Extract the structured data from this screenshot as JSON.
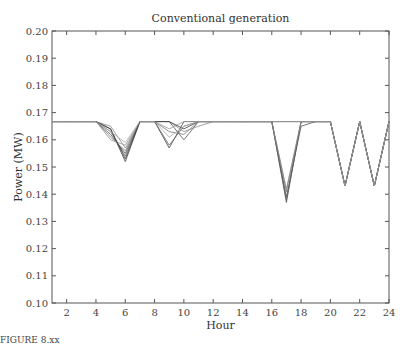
{
  "chart_data": {
    "type": "line",
    "title": "Conventional generation",
    "xlabel": "Hour",
    "ylabel": "Power (MW)",
    "xlim": [
      1,
      24
    ],
    "ylim": [
      0.1,
      0.2
    ],
    "xticks": [
      2,
      4,
      6,
      8,
      10,
      12,
      14,
      16,
      18,
      20,
      22,
      24
    ],
    "yticks": [
      "0.10",
      "0.11",
      "0.12",
      "0.13",
      "0.14",
      "0.15",
      "0.16",
      "0.17",
      "0.18",
      "0.19",
      "0.20"
    ],
    "grid": false,
    "legend": null,
    "x": [
      1,
      2,
      3,
      4,
      5,
      6,
      7,
      8,
      9,
      10,
      11,
      12,
      13,
      14,
      15,
      16,
      17,
      18,
      19,
      20,
      21,
      22,
      23,
      24
    ],
    "series": [
      {
        "name": "scenario-1",
        "values": [
          0.1667,
          0.1667,
          0.1667,
          0.1667,
          0.164,
          0.152,
          0.1667,
          0.1667,
          0.157,
          0.1667,
          0.1667,
          0.1667,
          0.1667,
          0.1667,
          0.1667,
          0.1667,
          0.137,
          0.1667,
          0.1667,
          0.1667,
          0.143,
          0.1667,
          0.143,
          0.1667
        ]
      },
      {
        "name": "scenario-2",
        "values": [
          0.1667,
          0.1667,
          0.1667,
          0.1667,
          0.163,
          0.154,
          0.1667,
          0.1667,
          0.158,
          0.165,
          0.1667,
          0.1667,
          0.1667,
          0.1667,
          0.1667,
          0.1667,
          0.138,
          0.1667,
          0.1667,
          0.1667,
          0.143,
          0.1667,
          0.143,
          0.1667
        ]
      },
      {
        "name": "scenario-3",
        "values": [
          0.1667,
          0.1667,
          0.1667,
          0.1667,
          0.162,
          0.155,
          0.1667,
          0.1667,
          0.1667,
          0.16,
          0.1667,
          0.1667,
          0.1667,
          0.1667,
          0.1667,
          0.1667,
          0.139,
          0.165,
          0.1667,
          0.1667,
          0.143,
          0.1667,
          0.143,
          0.1667
        ]
      },
      {
        "name": "scenario-4",
        "values": [
          0.1667,
          0.1667,
          0.1667,
          0.1667,
          0.161,
          0.156,
          0.1667,
          0.1667,
          0.163,
          0.162,
          0.1667,
          0.1667,
          0.1667,
          0.1667,
          0.1667,
          0.1667,
          0.141,
          0.1667,
          0.1667,
          0.1667,
          0.143,
          0.1667,
          0.143,
          0.1667
        ]
      },
      {
        "name": "scenario-5",
        "values": [
          0.1667,
          0.1667,
          0.1667,
          0.1667,
          0.165,
          0.157,
          0.1667,
          0.1667,
          0.1667,
          0.163,
          0.165,
          0.1667,
          0.1667,
          0.1667,
          0.1667,
          0.1667,
          0.142,
          0.1667,
          0.1667,
          0.1667,
          0.143,
          0.1667,
          0.143,
          0.1667
        ]
      },
      {
        "name": "scenario-6",
        "values": [
          0.1667,
          0.1667,
          0.1667,
          0.1667,
          0.16,
          0.158,
          0.1667,
          0.1667,
          0.164,
          0.1667,
          0.1667,
          0.1667,
          0.1667,
          0.1667,
          0.1667,
          0.1667,
          0.1667,
          0.1667,
          0.1667,
          0.1667,
          0.143,
          0.1667,
          0.143,
          0.1667
        ]
      },
      {
        "name": "scenario-7",
        "values": [
          0.1667,
          0.1667,
          0.1667,
          0.1667,
          0.164,
          0.153,
          0.1667,
          0.1667,
          0.1667,
          0.164,
          0.1667,
          0.1667,
          0.1667,
          0.1667,
          0.1667,
          0.1667,
          0.1667,
          0.1667,
          0.1667,
          0.1667,
          0.143,
          0.1667,
          0.143,
          0.1667
        ]
      },
      {
        "name": "scenario-8",
        "values": [
          0.1667,
          0.1667,
          0.1667,
          0.1667,
          0.163,
          0.159,
          0.1667,
          0.1667,
          0.161,
          0.165,
          0.1667,
          0.1667,
          0.1667,
          0.1667,
          0.1667,
          0.1667,
          0.1667,
          0.1667,
          0.1667,
          0.1667,
          0.143,
          0.1667,
          0.143,
          0.1667
        ]
      }
    ]
  },
  "caption_fragment": "FIGURE 8.xx"
}
